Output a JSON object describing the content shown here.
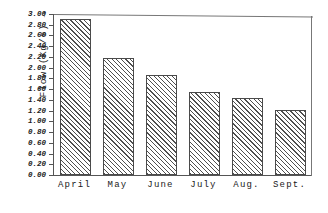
{
  "chart_data": {
    "type": "bar",
    "title": "",
    "xlabel": "",
    "ylabel": "Flow (Kg/s) →",
    "categories": [
      "April",
      "May",
      "June",
      "July",
      "Aug.",
      "Sept."
    ],
    "values": [
      2.9,
      2.18,
      1.86,
      1.54,
      1.44,
      1.22
    ],
    "ylim": [
      0.0,
      3.0
    ],
    "ytick_step": 0.2,
    "ytick_labels": [
      "3.00",
      "2.80",
      "2.60",
      "2.40",
      "2.20",
      "2.00",
      "1.80",
      "1.60",
      "1.40",
      "1.20",
      "1.00",
      "0.80",
      "0.60",
      "0.40",
      "0.20",
      "0.00"
    ],
    "ytick_values": [
      3.0,
      2.8,
      2.6,
      2.4,
      2.2,
      2.0,
      1.8,
      1.6,
      1.4,
      1.2,
      1.0,
      0.8,
      0.6,
      0.4,
      0.2,
      0.0
    ],
    "grid": false,
    "legend": null,
    "legend_position": "none",
    "series": [
      {
        "name": "Flow",
        "values": [
          2.9,
          2.18,
          1.86,
          1.54,
          1.44,
          1.22
        ],
        "fill": "diagonal-hatch",
        "edge_color": "#4a4a4a",
        "hatch_color": "#4f4f4f"
      }
    ],
    "axis_color": "#555555",
    "frame_color": "#777777",
    "background": "#ffffff"
  }
}
